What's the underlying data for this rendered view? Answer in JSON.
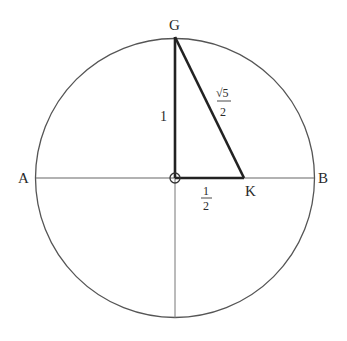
{
  "diagram": {
    "points": {
      "G": "G",
      "A": "A",
      "B": "B",
      "K": "K"
    },
    "edge_labels": {
      "vertical": "1",
      "hypotenuse_num": "√5",
      "hypotenuse_den": "2",
      "horizontal_num": "1",
      "horizontal_den": "2"
    },
    "colors": {
      "line": "#555555",
      "triangle": "#222222",
      "text": "#2a2a2a"
    }
  }
}
